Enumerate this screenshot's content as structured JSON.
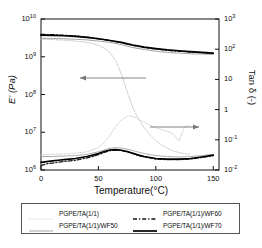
{
  "chart_data": {
    "type": "line",
    "title": "",
    "xlabel": "Temperature(°C)",
    "ylabel_left": "E' (Pa)",
    "ylabel_right": "Tan δ (-)",
    "xlim": [
      0,
      155
    ],
    "xticks": [
      0,
      50,
      100,
      150
    ],
    "xtick_labels": [
      "0",
      "50",
      "100",
      "150"
    ],
    "ylim_left": [
      1000000,
      10000000000
    ],
    "yticks_left": [
      1000000,
      10000000,
      100000000,
      1000000000,
      10000000000
    ],
    "ytick_labels_left": [
      "10",
      "10",
      "10",
      "10",
      "10"
    ],
    "ytick_exponents_left": [
      "6",
      "7",
      "8",
      "9",
      "10"
    ],
    "ylim_right": [
      0.01,
      1000
    ],
    "yticks_right": [
      0.01,
      0.1,
      1,
      10,
      100,
      1000
    ],
    "ytick_labels_right": [
      "10",
      "10",
      "1",
      "10",
      "10",
      "10"
    ],
    "ytick_exponents_right": [
      "-2",
      "-1",
      "",
      "",
      "2",
      "3"
    ],
    "grid": false,
    "legend_position": "below-plot",
    "annotations": [
      {
        "name": "left-arrow",
        "text": "",
        "points_to": "left-axis",
        "x_data": 30,
        "y_note": "mid-upper plot"
      },
      {
        "name": "right-arrow",
        "text": "",
        "points_to": "right-axis",
        "x_data": 95,
        "y_note": "mid-lower plot"
      }
    ],
    "series": [
      {
        "name": "PGPE/TA(1/1)",
        "axis": "left",
        "quantity": "E'",
        "style": "dotted",
        "color": "#b9b9b9",
        "x": [
          0,
          5,
          10,
          15,
          20,
          25,
          30,
          35,
          40,
          45,
          50,
          55,
          60,
          65,
          70,
          75,
          80,
          85,
          90,
          95,
          100,
          105,
          110,
          115,
          120,
          125,
          130
        ],
        "values": [
          2900000000.0,
          2900000000.0,
          2850000000.0,
          2800000000.0,
          2750000000.0,
          2700000000.0,
          2600000000.0,
          2500000000.0,
          2400000000.0,
          2250000000.0,
          2000000000.0,
          1700000000.0,
          1300000000.0,
          800000000.0,
          350000000.0,
          120000000.0,
          45000000.0,
          22000000.0,
          13000000.0,
          8500000.0,
          6000000.0,
          4600000.0,
          3800000.0,
          3200000.0,
          2900000.0,
          2700000.0,
          2600000.0
        ]
      },
      {
        "name": "PGPE/TA(1/1)/WF50",
        "axis": "left",
        "quantity": "E'",
        "style": "solid-thin",
        "color": "#9a9a9a",
        "x": [
          0,
          10,
          20,
          30,
          40,
          50,
          60,
          70,
          80,
          90,
          100,
          110,
          120,
          130,
          140,
          150
        ],
        "values": [
          3100000000.0,
          3050000000.0,
          3000000000.0,
          2900000000.0,
          2800000000.0,
          2600000000.0,
          2400000000.0,
          2100000000.0,
          1750000000.0,
          1550000000.0,
          1400000000.0,
          1300000000.0,
          1250000000.0,
          1200000000.0,
          1180000000.0,
          1150000000.0
        ]
      },
      {
        "name": "PGPE/TA(1/1)/WF60",
        "axis": "left",
        "quantity": "E'",
        "style": "dashed",
        "color": "#141414",
        "x": [
          0,
          10,
          20,
          30,
          40,
          50,
          60,
          70,
          80,
          90,
          100,
          110,
          120,
          130,
          140,
          150
        ],
        "values": [
          3900000000.0,
          3850000000.0,
          3700000000.0,
          3550000000.0,
          3300000000.0,
          3000000000.0,
          2700000000.0,
          2350000000.0,
          2000000000.0,
          1750000000.0,
          1600000000.0,
          1480000000.0,
          1400000000.0,
          1330000000.0,
          1280000000.0,
          1220000000.0
        ]
      },
      {
        "name": "PGPE/TA(1/1)/WF70",
        "axis": "left",
        "quantity": "E'",
        "style": "solid-thick",
        "color": "#000000",
        "x": [
          0,
          10,
          20,
          30,
          40,
          50,
          60,
          70,
          80,
          90,
          100,
          110,
          120,
          130,
          140,
          150
        ],
        "values": [
          3750000000.0,
          3700000000.0,
          3600000000.0,
          3450000000.0,
          3250000000.0,
          3000000000.0,
          2700000000.0,
          2400000000.0,
          2050000000.0,
          1800000000.0,
          1650000000.0,
          1520000000.0,
          1440000000.0,
          1360000000.0,
          1300000000.0,
          1250000000.0
        ]
      },
      {
        "name": "PGPE/TA(1/1)",
        "axis": "right",
        "quantity": "Tan delta",
        "style": "dotted",
        "color": "#c6c6c6",
        "x": [
          0,
          10,
          20,
          30,
          40,
          50,
          55,
          60,
          65,
          70,
          75,
          78,
          82,
          86,
          90,
          95,
          100,
          105,
          110,
          115,
          120,
          125,
          130
        ],
        "values": [
          0.032,
          0.033,
          0.034,
          0.036,
          0.04,
          0.055,
          0.08,
          0.14,
          0.28,
          0.45,
          0.6,
          0.62,
          0.55,
          0.45,
          0.38,
          0.3,
          0.25,
          0.22,
          0.19,
          0.16,
          0.09,
          0.27,
          0.3
        ]
      },
      {
        "name": "PGPE/TA(1/1)/WF50",
        "axis": "right",
        "quantity": "Tan delta",
        "style": "solid-thin",
        "color": "#a5a5a5",
        "x": [
          0,
          10,
          20,
          30,
          40,
          50,
          55,
          60,
          65,
          70,
          75,
          80,
          85,
          90,
          95,
          100,
          110,
          120,
          130,
          140,
          150
        ],
        "values": [
          0.028,
          0.028,
          0.029,
          0.03,
          0.033,
          0.04,
          0.046,
          0.052,
          0.055,
          0.053,
          0.049,
          0.044,
          0.039,
          0.035,
          0.032,
          0.03,
          0.028,
          0.027,
          0.028,
          0.03,
          0.033
        ]
      },
      {
        "name": "PGPE/TA(1/1)/WF60",
        "axis": "right",
        "quantity": "Tan delta",
        "style": "dashed",
        "color": "#1a1a1a",
        "x": [
          0,
          5,
          10,
          15,
          20,
          25,
          30,
          35,
          40,
          45,
          50,
          55,
          60,
          65,
          70,
          75,
          80,
          85,
          90,
          100,
          110,
          120,
          130,
          140,
          150
        ],
        "values": [
          0.014,
          0.016,
          0.017,
          0.018,
          0.019,
          0.02,
          0.021,
          0.023,
          0.025,
          0.028,
          0.032,
          0.038,
          0.044,
          0.046,
          0.044,
          0.04,
          0.035,
          0.03,
          0.027,
          0.023,
          0.022,
          0.022,
          0.023,
          0.026,
          0.03
        ]
      },
      {
        "name": "PGPE/TA(1/1)/WF70",
        "axis": "right",
        "quantity": "Tan delta",
        "style": "solid-thick",
        "color": "#000000",
        "x": [
          0,
          5,
          10,
          15,
          20,
          25,
          30,
          35,
          40,
          45,
          50,
          55,
          60,
          65,
          70,
          75,
          80,
          85,
          90,
          100,
          110,
          120,
          130,
          140,
          150
        ],
        "values": [
          0.018,
          0.019,
          0.02,
          0.021,
          0.022,
          0.023,
          0.024,
          0.026,
          0.028,
          0.031,
          0.035,
          0.041,
          0.046,
          0.047,
          0.045,
          0.041,
          0.036,
          0.031,
          0.028,
          0.024,
          0.023,
          0.023,
          0.024,
          0.027,
          0.031
        ]
      }
    ]
  },
  "legend": {
    "entries": [
      {
        "label": "PGPE/TA(1/1)",
        "style": "dotted",
        "color": "#b9b9b9"
      },
      {
        "label": "PGPE/TA(1/1)/WF50",
        "style": "solid-thin",
        "color": "#9a9a9a"
      },
      {
        "label": "PGPE/TA(1/1)/WF60",
        "style": "dashed",
        "color": "#141414"
      },
      {
        "label": "PGPE/TA(1/1)/WF70",
        "style": "solid-thick",
        "color": "#000000"
      }
    ]
  }
}
